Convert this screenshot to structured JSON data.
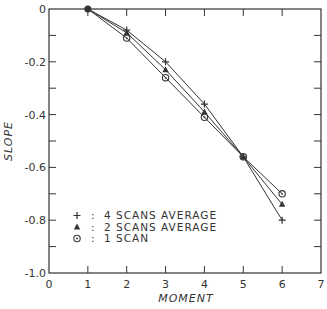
{
  "chart_data": {
    "type": "line",
    "title": "",
    "xlabel": "MOMENT",
    "ylabel": "SLOPE",
    "xlim": [
      0,
      7
    ],
    "ylim": [
      -1.0,
      0
    ],
    "x_ticks": [
      "0",
      "1",
      "2",
      "3",
      "4",
      "5",
      "6",
      "7"
    ],
    "y_ticks": [
      "0",
      "-0.2",
      "-0.4",
      "-0.6",
      "-0.8",
      "-1.0"
    ],
    "grid": false,
    "legend_position": "lower-left inside",
    "x": [
      1,
      2,
      3,
      4,
      5,
      6
    ],
    "series": [
      {
        "name": "4 SCANS AVERAGE",
        "marker": "+",
        "values": [
          0,
          -0.08,
          -0.2,
          -0.36,
          -0.56,
          -0.8
        ]
      },
      {
        "name": "2 SCANS AVERAGE",
        "marker": "▲",
        "values": [
          0,
          -0.09,
          -0.23,
          -0.39,
          -0.56,
          -0.74
        ]
      },
      {
        "name": "1 SCAN",
        "marker": "⊙",
        "values": [
          0,
          -0.11,
          -0.26,
          -0.41,
          -0.56,
          -0.7
        ]
      }
    ]
  },
  "legend": {
    "items": [
      {
        "symbol": "+",
        "sep": ":",
        "label": "4 SCANS AVERAGE"
      },
      {
        "symbol": "▲",
        "sep": ":",
        "label": "2 SCANS AVERAGE"
      },
      {
        "symbol": "⊙",
        "sep": ":",
        "label": "1 SCAN"
      }
    ]
  },
  "colors": {
    "line": "#333333",
    "axis": "#333333",
    "background": "#ffffff"
  }
}
